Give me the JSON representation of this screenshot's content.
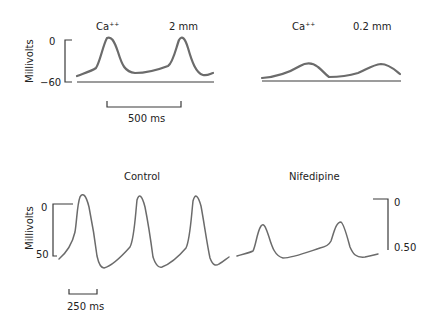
{
  "panels": {
    "top_left": {
      "ion_label": "Ca",
      "ion_superscript": "++",
      "concentration": "2 mm",
      "y_axis_label": "Millivolts",
      "y_ticks": [
        "0",
        "−60"
      ],
      "time_scale": "500 ms"
    },
    "top_right": {
      "ion_label": "Ca",
      "ion_superscript": "++",
      "concentration": "0.2 mm"
    },
    "bottom_left": {
      "title": "Control",
      "y_axis_label": "Millivolts",
      "y_ticks": [
        "0",
        "50"
      ],
      "time_scale": "250 ms"
    },
    "bottom_right": {
      "title": "Nifedipine",
      "y_ticks": [
        "0",
        "0.50"
      ]
    }
  },
  "colors": {
    "trace": "#6b6b6b",
    "axis": "#3a3a3a",
    "text": "#222222"
  }
}
